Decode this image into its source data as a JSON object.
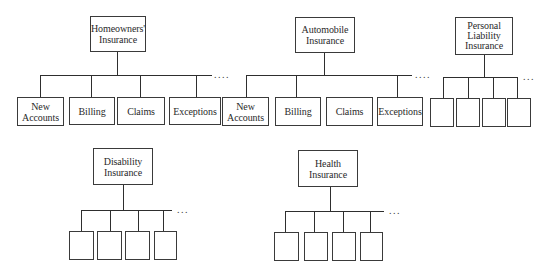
{
  "diagram": {
    "type": "hierarchy",
    "continuation_marker": "....",
    "continuation_marker_short": "...",
    "groups": [
      {
        "id": "homeowners",
        "title": "Homeowners'\nInsurance",
        "children": [
          "New\nAccounts",
          "Billing",
          "Claims",
          "Exceptions"
        ],
        "more": true
      },
      {
        "id": "automobile",
        "title": "Automobile\nInsurance",
        "children": [
          "New\nAccounts",
          "Billing",
          "Claims",
          "Exceptions"
        ],
        "more": true
      },
      {
        "id": "personal-liability",
        "title": "Personal\nLiability\nInsurance",
        "children": [
          "",
          "",
          "",
          ""
        ],
        "more": true
      },
      {
        "id": "disability",
        "title": "Disability\nInsurance",
        "children": [
          "",
          "",
          "",
          ""
        ],
        "more": true
      },
      {
        "id": "health",
        "title": "Health\nInsurance",
        "children": [
          "",
          "",
          "",
          ""
        ],
        "more": true
      }
    ]
  }
}
